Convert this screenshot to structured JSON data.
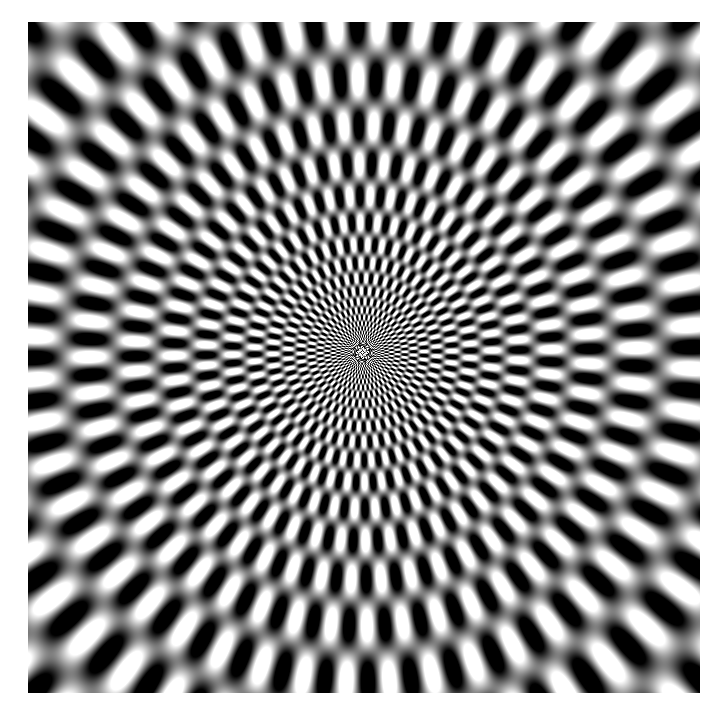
{
  "image": {
    "kind": "spiral-optical-illusion",
    "description": "Radial spiral pattern of alternating black and white elliptical blobs converging to a center point",
    "frame": {
      "x": 28,
      "y": 22,
      "width": 672,
      "height": 671
    },
    "center": {
      "x": 362,
      "y": 352
    },
    "colors": {
      "background": "#ffffff",
      "dark": "#000000",
      "light": "#ffffff",
      "mid": "#808080"
    },
    "pattern": {
      "arms": 48,
      "twist": 0.55,
      "ring_scale": 14
    }
  }
}
